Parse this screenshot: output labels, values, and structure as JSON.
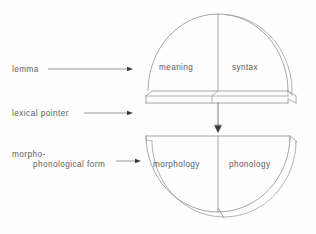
{
  "figure": {
    "stroke_color": "#8a8a8a",
    "text_color": "#5a5a5a",
    "background": "#fefefe"
  },
  "labels": [
    {
      "name": "lemma",
      "text": "lemma"
    },
    {
      "name": "lexical-pointer",
      "text": "lexical pointer"
    },
    {
      "name": "morpho-phonological-form",
      "line1": "morpho-",
      "line2": "phonological form"
    }
  ],
  "lemma_block": {
    "name": "lemma-block",
    "left_region": "meaning",
    "right_region": "syntax"
  },
  "form_block": {
    "name": "morpho-phonological-form-block",
    "left_region": "morphology",
    "right_region": "phonology"
  },
  "connector": {
    "name": "lexical-pointer-arrow",
    "direction": "down"
  }
}
